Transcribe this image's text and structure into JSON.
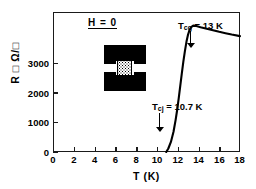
{
  "figure": {
    "x_title": "T  (K)",
    "y_title": "R □ Ω/□",
    "field_annotation": "H = 0"
  },
  "annotations": {
    "tcg": {
      "symbol": "T",
      "sub": "cg",
      "text": " = 13 K",
      "temperature": 13,
      "arrow_x": 13.0
    },
    "tcj": {
      "symbol": "T",
      "sub": "cj",
      "text": " = 10.7 K",
      "temperature": 10.7,
      "arrow_x": 10.7
    }
  },
  "inset": {
    "name": "granular-weak-link-junction-schematic"
  },
  "chart_data": {
    "type": "line",
    "title": "",
    "xlabel": "T  (K)",
    "ylabel": "R □ Ω/□",
    "xlim": [
      0,
      18
    ],
    "ylim": [
      0,
      3600
    ],
    "xticks": [
      0,
      2,
      4,
      6,
      8,
      10,
      12,
      14,
      16,
      18
    ],
    "yticks": [
      0,
      1000,
      2000,
      3000
    ],
    "grid": false,
    "legend": null,
    "series": [
      {
        "name": "R vs T",
        "x": [
          10.9,
          11.1,
          11.35,
          11.6,
          11.8,
          11.95,
          12.1,
          12.25,
          12.4,
          12.55,
          12.7,
          12.85,
          13.0,
          13.15,
          13.3,
          13.5,
          13.8,
          14.2,
          14.8,
          15.4,
          16.0,
          16.6,
          17.2,
          18.0
        ],
        "y": [
          0,
          90,
          260,
          520,
          820,
          1080,
          1380,
          1700,
          2020,
          2330,
          2600,
          2840,
          3020,
          3140,
          3210,
          3250,
          3240,
          3210,
          3170,
          3130,
          3090,
          3055,
          3020,
          2980
        ]
      }
    ],
    "annotations": [
      {
        "label": "T_cg = 13 K",
        "x": 13.0,
        "kind": "arrow-down"
      },
      {
        "label": "T_cj = 10.7 K",
        "x": 10.7,
        "kind": "arrow-down"
      },
      {
        "label": "H = 0",
        "kind": "text"
      }
    ]
  }
}
